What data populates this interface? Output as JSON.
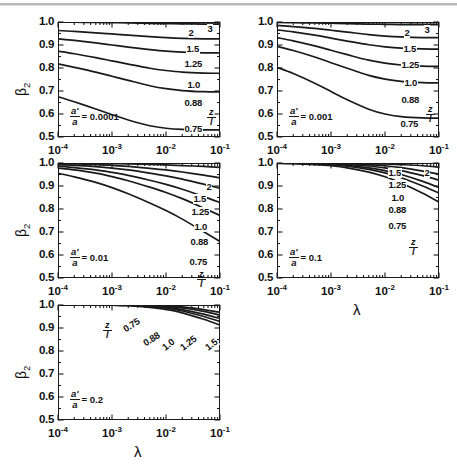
{
  "figure": {
    "background": "#ffffff",
    "line_color": "#1a1a1a",
    "ylabel": "β2",
    "xlabel": "λ",
    "ratio_label_numerator": "z",
    "ratio_label_denominator": "l",
    "param_numerator": "a'",
    "param_denominator": "a",
    "y_ticks": [
      "1.0",
      "0.9",
      "0.8",
      "0.7",
      "0.6",
      "0.5"
    ],
    "x_ticks": [
      "10-4",
      "10-3",
      "10-2",
      "10-1"
    ],
    "x_tick_mantissa": [
      "10",
      "10",
      "10",
      "10"
    ],
    "x_tick_exponent": [
      "-4",
      "-3",
      "-2",
      "-1"
    ]
  },
  "chart_data": [
    {
      "type": "line",
      "title": "",
      "panel_id": "panel-1",
      "annotation": "a'/a = 0.0001",
      "annotation_value": "0.0001",
      "xlabel": "λ",
      "ylabel": "β2",
      "xscale": "log",
      "xlim": [
        0.0001,
        0.1
      ],
      "ylim": [
        0.5,
        1.0
      ],
      "grid": false,
      "legend": "inline curve labels on right",
      "series": [
        {
          "name": "3",
          "label": "3",
          "x": [
            0.0001,
            0.0002,
            0.0005,
            0.001,
            0.002,
            0.005,
            0.01,
            0.02,
            0.05,
            0.1
          ],
          "values": [
            1.0,
            1.0,
            1.0,
            1.0,
            1.0,
            0.999,
            0.999,
            0.999,
            0.998,
            0.998
          ]
        },
        {
          "name": "2",
          "label": "2",
          "x": [
            0.0001,
            0.0002,
            0.0005,
            0.001,
            0.002,
            0.005,
            0.01,
            0.02,
            0.05,
            0.1
          ],
          "values": [
            0.999,
            0.999,
            0.998,
            0.997,
            0.996,
            0.994,
            0.993,
            0.992,
            0.991,
            0.991
          ]
        },
        {
          "name": "1.5",
          "label": "1.5",
          "x": [
            0.0001,
            0.0002,
            0.0005,
            0.001,
            0.002,
            0.005,
            0.01,
            0.02,
            0.05,
            0.1
          ],
          "values": [
            0.963,
            0.959,
            0.953,
            0.948,
            0.943,
            0.936,
            0.932,
            0.929,
            0.927,
            0.927
          ]
        },
        {
          "name": "1.25",
          "label": "1.25",
          "x": [
            0.0001,
            0.0002,
            0.0005,
            0.001,
            0.002,
            0.005,
            0.01,
            0.02,
            0.05,
            0.1
          ],
          "values": [
            0.927,
            0.92,
            0.909,
            0.9,
            0.891,
            0.88,
            0.873,
            0.869,
            0.866,
            0.866
          ]
        },
        {
          "name": "1.0",
          "label": "1.0",
          "x": [
            0.0001,
            0.0002,
            0.0005,
            0.001,
            0.002,
            0.005,
            0.01,
            0.02,
            0.05,
            0.1
          ],
          "values": [
            0.873,
            0.862,
            0.845,
            0.831,
            0.817,
            0.799,
            0.789,
            0.782,
            0.778,
            0.777
          ]
        },
        {
          "name": "0.88",
          "label": "0.88",
          "x": [
            0.0001,
            0.0002,
            0.0005,
            0.001,
            0.002,
            0.005,
            0.01,
            0.02,
            0.05,
            0.1
          ],
          "values": [
            0.818,
            0.803,
            0.782,
            0.764,
            0.746,
            0.723,
            0.71,
            0.702,
            0.697,
            0.696
          ]
        },
        {
          "name": "0.75",
          "label": "0.75",
          "x": [
            0.0001,
            0.0002,
            0.0005,
            0.001,
            0.002,
            0.005,
            0.01,
            0.02,
            0.05,
            0.1
          ],
          "values": [
            0.675,
            0.653,
            0.622,
            0.597,
            0.574,
            0.549,
            0.538,
            0.533,
            0.531,
            0.531
          ]
        }
      ]
    },
    {
      "type": "line",
      "title": "",
      "panel_id": "panel-2",
      "annotation": "a'/a = 0.001",
      "annotation_value": "0.001",
      "xlabel": "λ",
      "ylabel": "β2",
      "xscale": "log",
      "xlim": [
        0.0001,
        0.1
      ],
      "ylim": [
        0.5,
        1.0
      ],
      "grid": false,
      "legend": "inline curve labels on right",
      "series": [
        {
          "name": "3",
          "label": "3",
          "x": [
            0.0001,
            0.0002,
            0.0005,
            0.001,
            0.002,
            0.005,
            0.01,
            0.02,
            0.05,
            0.1
          ],
          "values": [
            1.0,
            1.0,
            1.0,
            0.999,
            0.999,
            0.999,
            0.998,
            0.998,
            0.997,
            0.997
          ]
        },
        {
          "name": "2",
          "label": "2",
          "x": [
            0.0001,
            0.0002,
            0.0005,
            0.001,
            0.002,
            0.005,
            0.01,
            0.02,
            0.05,
            0.1
          ],
          "values": [
            0.998,
            0.997,
            0.996,
            0.995,
            0.993,
            0.991,
            0.99,
            0.989,
            0.988,
            0.988
          ]
        },
        {
          "name": "1.5",
          "label": "1.5",
          "x": [
            0.0001,
            0.0002,
            0.0005,
            0.001,
            0.002,
            0.005,
            0.01,
            0.02,
            0.05,
            0.1
          ],
          "values": [
            0.985,
            0.98,
            0.972,
            0.964,
            0.956,
            0.945,
            0.939,
            0.935,
            0.932,
            0.932
          ]
        },
        {
          "name": "1.25",
          "label": "1.25",
          "x": [
            0.0001,
            0.0002,
            0.0005,
            0.001,
            0.002,
            0.005,
            0.01,
            0.02,
            0.05,
            0.1
          ],
          "values": [
            0.966,
            0.957,
            0.943,
            0.93,
            0.917,
            0.901,
            0.892,
            0.886,
            0.883,
            0.882
          ]
        },
        {
          "name": "1.0",
          "label": "1.0",
          "x": [
            0.0001,
            0.0002,
            0.0005,
            0.001,
            0.002,
            0.005,
            0.01,
            0.02,
            0.05,
            0.1
          ],
          "values": [
            0.932,
            0.918,
            0.896,
            0.877,
            0.858,
            0.834,
            0.821,
            0.813,
            0.808,
            0.807
          ]
        },
        {
          "name": "0.88",
          "label": "0.88",
          "x": [
            0.0001,
            0.0002,
            0.0005,
            0.001,
            0.002,
            0.005,
            0.01,
            0.02,
            0.05,
            0.1
          ],
          "values": [
            0.894,
            0.876,
            0.848,
            0.823,
            0.799,
            0.768,
            0.752,
            0.742,
            0.736,
            0.735
          ]
        },
        {
          "name": "0.75",
          "label": "0.75",
          "x": [
            0.0001,
            0.0002,
            0.0005,
            0.001,
            0.002,
            0.005,
            0.01,
            0.02,
            0.05,
            0.1
          ],
          "values": [
            0.803,
            0.776,
            0.734,
            0.698,
            0.662,
            0.621,
            0.6,
            0.589,
            0.583,
            0.582
          ]
        }
      ]
    },
    {
      "type": "line",
      "title": "",
      "panel_id": "panel-3",
      "annotation": "a'/a = 0.01",
      "annotation_value": "0.01",
      "xlabel": "λ",
      "ylabel": "β2",
      "xscale": "log",
      "xlim": [
        0.0001,
        0.1
      ],
      "ylim": [
        0.5,
        1.0
      ],
      "grid": false,
      "legend": "inline curve labels on right",
      "series": [
        {
          "name": "2",
          "label": "2",
          "x": [
            0.0001,
            0.0002,
            0.0005,
            0.001,
            0.002,
            0.005,
            0.01,
            0.02,
            0.05,
            0.1
          ],
          "values": [
            0.999,
            0.999,
            0.998,
            0.997,
            0.996,
            0.994,
            0.992,
            0.989,
            0.985,
            0.981
          ]
        },
        {
          "name": "1.5",
          "label": "1.5",
          "x": [
            0.0001,
            0.0002,
            0.0005,
            0.001,
            0.002,
            0.005,
            0.01,
            0.02,
            0.05,
            0.1
          ],
          "values": [
            0.997,
            0.996,
            0.993,
            0.99,
            0.985,
            0.977,
            0.97,
            0.961,
            0.947,
            0.935
          ]
        },
        {
          "name": "1.25",
          "label": "1.25",
          "x": [
            0.0001,
            0.0002,
            0.0005,
            0.001,
            0.002,
            0.005,
            0.01,
            0.02,
            0.05,
            0.1
          ],
          "values": [
            0.993,
            0.99,
            0.984,
            0.978,
            0.97,
            0.956,
            0.944,
            0.93,
            0.908,
            0.89
          ]
        },
        {
          "name": "1.0",
          "label": "1.0",
          "x": [
            0.0001,
            0.0002,
            0.0005,
            0.001,
            0.002,
            0.005,
            0.01,
            0.02,
            0.05,
            0.1
          ],
          "values": [
            0.986,
            0.98,
            0.97,
            0.959,
            0.946,
            0.925,
            0.907,
            0.886,
            0.854,
            0.828
          ]
        },
        {
          "name": "0.88",
          "label": "0.88",
          "x": [
            0.0001,
            0.0002,
            0.0005,
            0.001,
            0.002,
            0.005,
            0.01,
            0.02,
            0.05,
            0.1
          ],
          "values": [
            0.978,
            0.97,
            0.956,
            0.941,
            0.923,
            0.895,
            0.872,
            0.845,
            0.804,
            0.772
          ]
        },
        {
          "name": "0.75",
          "label": "0.75",
          "x": [
            0.0001,
            0.0002,
            0.0005,
            0.001,
            0.002,
            0.005,
            0.01,
            0.02,
            0.05,
            0.1
          ],
          "values": [
            0.955,
            0.94,
            0.916,
            0.893,
            0.866,
            0.826,
            0.793,
            0.756,
            0.701,
            0.659
          ]
        }
      ]
    },
    {
      "type": "line",
      "title": "",
      "panel_id": "panel-4",
      "annotation": "a'/a = 0.1",
      "annotation_value": "0.1",
      "xlabel": "λ",
      "ylabel": "β2",
      "xscale": "log",
      "xlim": [
        0.0001,
        0.1
      ],
      "ylim": [
        0.5,
        1.0
      ],
      "grid": false,
      "legend": "inline curve labels on right",
      "series": [
        {
          "name": "2",
          "label": "2",
          "x": [
            0.0001,
            0.0002,
            0.0005,
            0.001,
            0.002,
            0.005,
            0.01,
            0.02,
            0.05,
            0.1
          ],
          "values": [
            1.0,
            1.0,
            1.0,
            0.9995,
            0.999,
            0.998,
            0.996,
            0.993,
            0.988,
            0.982
          ]
        },
        {
          "name": "1.5",
          "label": "1.5",
          "x": [
            0.0001,
            0.0002,
            0.0005,
            0.001,
            0.002,
            0.005,
            0.01,
            0.02,
            0.05,
            0.1
          ],
          "values": [
            1.0,
            1.0,
            0.9995,
            0.999,
            0.997,
            0.993,
            0.988,
            0.98,
            0.965,
            0.951
          ]
        },
        {
          "name": "1.25",
          "label": "1.25",
          "x": [
            0.0001,
            0.0002,
            0.0005,
            0.001,
            0.002,
            0.005,
            0.01,
            0.02,
            0.05,
            0.1
          ],
          "values": [
            1.0,
            0.9995,
            0.999,
            0.997,
            0.994,
            0.987,
            0.979,
            0.967,
            0.945,
            0.925
          ]
        },
        {
          "name": "1.0",
          "label": "1.0",
          "x": [
            0.0001,
            0.0002,
            0.0005,
            0.001,
            0.002,
            0.005,
            0.01,
            0.02,
            0.05,
            0.1
          ],
          "values": [
            0.9995,
            0.999,
            0.997,
            0.995,
            0.99,
            0.979,
            0.967,
            0.95,
            0.92,
            0.893
          ]
        },
        {
          "name": "0.88",
          "label": "0.88",
          "x": [
            0.0001,
            0.0002,
            0.0005,
            0.001,
            0.002,
            0.005,
            0.01,
            0.02,
            0.05,
            0.1
          ],
          "values": [
            0.999,
            0.998,
            0.996,
            0.992,
            0.986,
            0.972,
            0.957,
            0.936,
            0.9,
            0.869
          ]
        },
        {
          "name": "0.75",
          "label": "0.75",
          "x": [
            0.0001,
            0.0002,
            0.0005,
            0.001,
            0.002,
            0.005,
            0.01,
            0.02,
            0.05,
            0.1
          ],
          "values": [
            0.998,
            0.997,
            0.993,
            0.988,
            0.979,
            0.96,
            0.94,
            0.913,
            0.868,
            0.83
          ]
        }
      ]
    },
    {
      "type": "line",
      "title": "",
      "panel_id": "panel-5",
      "annotation": "a'/a = 0.2",
      "annotation_value": "0.2",
      "xlabel": "λ",
      "ylabel": "β2",
      "xscale": "log",
      "xlim": [
        0.0001,
        0.1
      ],
      "ylim": [
        0.5,
        1.0
      ],
      "grid": false,
      "legend": "inline curve labels on curves",
      "series": [
        {
          "name": "0.75",
          "label": "0.75",
          "x": [
            0.0001,
            0.0005,
            0.001,
            0.002,
            0.005,
            0.01,
            0.02,
            0.05,
            0.1
          ],
          "values": [
            1.0,
            1.0,
            0.999,
            0.997,
            0.99,
            0.981,
            0.966,
            0.938,
            0.913
          ]
        },
        {
          "name": "0.88",
          "label": "0.88",
          "x": [
            0.0001,
            0.0005,
            0.001,
            0.002,
            0.005,
            0.01,
            0.02,
            0.05,
            0.1
          ],
          "values": [
            1.0,
            1.0,
            0.9995,
            0.998,
            0.993,
            0.986,
            0.974,
            0.95,
            0.928
          ]
        },
        {
          "name": "1.0",
          "label": "1.0",
          "x": [
            0.0001,
            0.0005,
            0.001,
            0.002,
            0.005,
            0.01,
            0.02,
            0.05,
            0.1
          ],
          "values": [
            1.0,
            1.0,
            1.0,
            0.999,
            0.995,
            0.99,
            0.98,
            0.96,
            0.941
          ]
        },
        {
          "name": "1.25",
          "label": "1.25",
          "x": [
            0.0001,
            0.0005,
            0.001,
            0.002,
            0.005,
            0.01,
            0.02,
            0.05,
            0.1
          ],
          "values": [
            1.0,
            1.0,
            1.0,
            0.9995,
            0.997,
            0.994,
            0.987,
            0.972,
            0.956
          ]
        },
        {
          "name": "1.5",
          "label": "1.5",
          "x": [
            0.0001,
            0.0005,
            0.001,
            0.002,
            0.005,
            0.01,
            0.02,
            0.05,
            0.1
          ],
          "values": [
            1.0,
            1.0,
            1.0,
            1.0,
            0.999,
            0.996,
            0.992,
            0.98,
            0.968
          ]
        }
      ]
    }
  ]
}
